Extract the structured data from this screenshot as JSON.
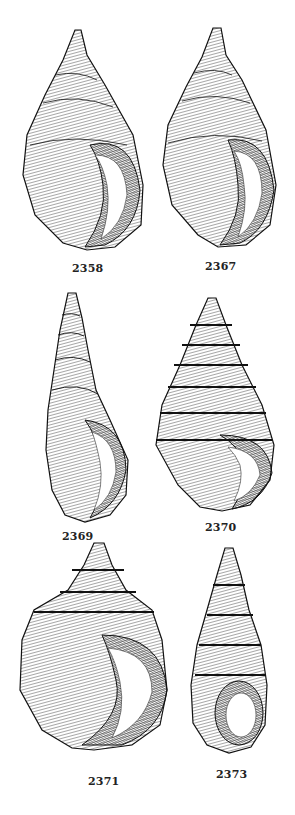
{
  "plate": {
    "figures": [
      {
        "id": "2358",
        "label": "2358"
      },
      {
        "id": "2367",
        "label": "2367"
      },
      {
        "id": "2369",
        "label": "2369"
      },
      {
        "id": "2370",
        "label": "2370"
      },
      {
        "id": "2371",
        "label": "2371"
      },
      {
        "id": "2373",
        "label": "2373"
      }
    ],
    "colors": {
      "ink": "#1a1a1a",
      "paper": "#ffffff"
    }
  }
}
